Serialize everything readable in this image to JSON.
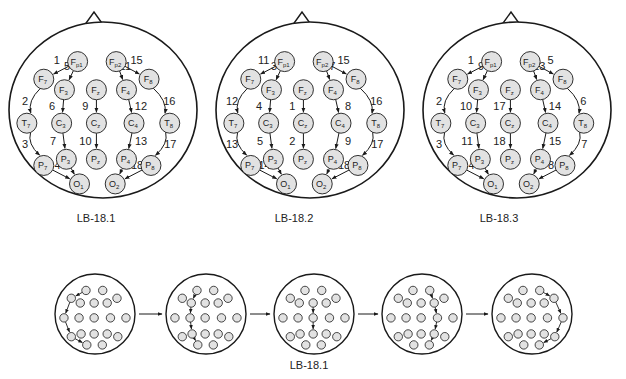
{
  "electrodes": {
    "Fp1": {
      "base": "F",
      "sub": "p1"
    },
    "Fp2": {
      "base": "F",
      "sub": "p2"
    },
    "F7": {
      "base": "F",
      "sub": "7"
    },
    "F3": {
      "base": "F",
      "sub": "3"
    },
    "Fz": {
      "base": "F",
      "sub": "z"
    },
    "F4": {
      "base": "F",
      "sub": "4"
    },
    "F8": {
      "base": "F",
      "sub": "8"
    },
    "T7": {
      "base": "T",
      "sub": "7"
    },
    "C3": {
      "base": "C",
      "sub": "3"
    },
    "Cz": {
      "base": "C",
      "sub": "z"
    },
    "C4": {
      "base": "C",
      "sub": "4"
    },
    "T8": {
      "base": "T",
      "sub": "8"
    },
    "P7": {
      "base": "P",
      "sub": "7"
    },
    "P3": {
      "base": "P",
      "sub": "3"
    },
    "Pz": {
      "base": "P",
      "sub": "z"
    },
    "P4": {
      "base": "P",
      "sub": "4"
    },
    "P8": {
      "base": "P",
      "sub": "8"
    },
    "O1": {
      "base": "O",
      "sub": "1"
    },
    "O2": {
      "base": "O",
      "sub": "2"
    }
  },
  "montages": [
    {
      "caption": "LB-18.1",
      "chains": [
        [
          "Fp1",
          "F7",
          1
        ],
        [
          "F7",
          "T7",
          2
        ],
        [
          "T7",
          "P7",
          3
        ],
        [
          "P7",
          "O1",
          4
        ],
        [
          "Fp1",
          "F3",
          5
        ],
        [
          "F3",
          "C3",
          6
        ],
        [
          "C3",
          "P3",
          7
        ],
        [
          "P3",
          "O1",
          8
        ],
        [
          "Fz",
          "Cz",
          9
        ],
        [
          "Cz",
          "Pz",
          10
        ],
        [
          "Fp2",
          "F4",
          11
        ],
        [
          "F4",
          "C4",
          12
        ],
        [
          "C4",
          "P4",
          13
        ],
        [
          "P4",
          "O2",
          14
        ],
        [
          "Fp2",
          "F8",
          15
        ],
        [
          "F8",
          "T8",
          16
        ],
        [
          "T8",
          "P8",
          17
        ],
        [
          "P8",
          "O2",
          18
        ]
      ]
    },
    {
      "caption": "LB-18.2",
      "chains": [
        [
          "Fz",
          "Cz",
          1
        ],
        [
          "Cz",
          "Pz",
          2
        ],
        [
          "Fp1",
          "F3",
          3
        ],
        [
          "F3",
          "C3",
          4
        ],
        [
          "C3",
          "P3",
          5
        ],
        [
          "P3",
          "O1",
          6
        ],
        [
          "Fp2",
          "F4",
          7
        ],
        [
          "F4",
          "C4",
          8
        ],
        [
          "C4",
          "P4",
          9
        ],
        [
          "P4",
          "O2",
          10
        ],
        [
          "Fp1",
          "F7",
          11
        ],
        [
          "F7",
          "T7",
          12
        ],
        [
          "T7",
          "P7",
          13
        ],
        [
          "P7",
          "O1",
          14
        ],
        [
          "Fp2",
          "F8",
          15
        ],
        [
          "F8",
          "T8",
          16
        ],
        [
          "T8",
          "P8",
          17
        ],
        [
          "P8",
          "O2",
          18
        ]
      ]
    },
    {
      "caption": "LB-18.3",
      "chains": [
        [
          "Fp1",
          "F7",
          1
        ],
        [
          "F7",
          "T7",
          2
        ],
        [
          "T7",
          "P7",
          3
        ],
        [
          "P7",
          "O1",
          4
        ],
        [
          "Fp2",
          "F8",
          5
        ],
        [
          "F8",
          "T8",
          6
        ],
        [
          "T8",
          "P8",
          7
        ],
        [
          "P8",
          "O2",
          8
        ],
        [
          "Fp1",
          "F3",
          9
        ],
        [
          "F3",
          "C3",
          10
        ],
        [
          "C3",
          "P3",
          11
        ],
        [
          "P3",
          "O1",
          12
        ],
        [
          "Fp2",
          "F4",
          13
        ],
        [
          "F4",
          "C4",
          14
        ],
        [
          "C4",
          "P4",
          15
        ],
        [
          "P4",
          "O2",
          16
        ],
        [
          "Fz",
          "Cz",
          17
        ],
        [
          "Cz",
          "Pz",
          18
        ]
      ]
    }
  ],
  "sequence": {
    "caption": "LB-18.1",
    "steps": [
      {
        "chain": [
          "Fp1",
          "F7",
          "T7",
          "P7",
          "O1"
        ]
      },
      {
        "chain": [
          "Fp1",
          "F3",
          "C3",
          "P3",
          "O1"
        ]
      },
      {
        "chain": [
          "Fz",
          "Cz",
          "Pz"
        ]
      },
      {
        "chain": [
          "Fp2",
          "F4",
          "C4",
          "P4",
          "O2"
        ]
      },
      {
        "chain": [
          "Fp2",
          "F8",
          "T8",
          "P8",
          "O2"
        ]
      }
    ]
  },
  "colors": {
    "electrode_fill": "#e2e2e2",
    "stroke": "#1a1a1a",
    "text": "#222222"
  }
}
